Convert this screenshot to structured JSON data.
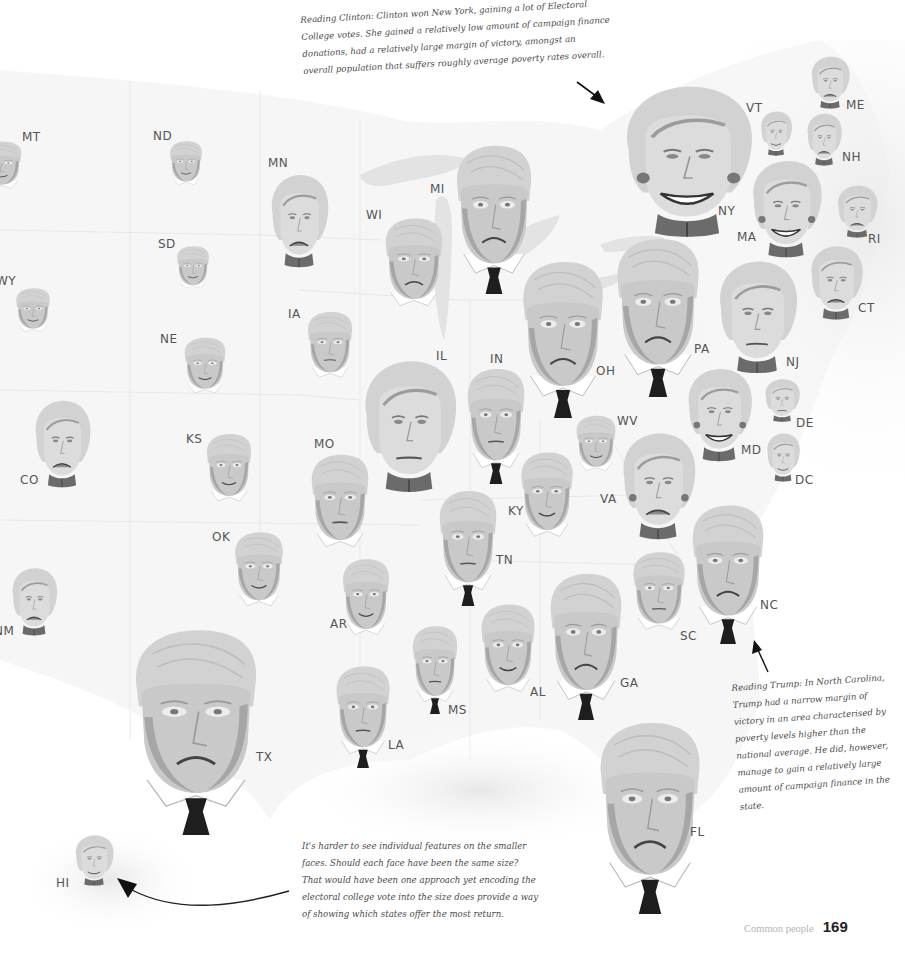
{
  "annotations": {
    "clinton": {
      "lines": [
        "Reading Clinton: Clinton won New York, gaining a lot of Electoral",
        "College votes. She gained a relatively low amount of campaign finance",
        "donations, had a relatively large margin of victory, amongst an",
        "overall population that suffers roughly average poverty rates overall."
      ]
    },
    "trump": {
      "lines": [
        "Reading Trump: In North Carolina,",
        "Trump had a narrow margin of",
        "victory in an area characterised by",
        "poverty levels higher than the",
        "national average. He did, however,",
        "manage to gain a relatively large",
        "amount of campaign finance in the",
        "state."
      ]
    },
    "size": {
      "lines": [
        "It's harder to see individual features on the smaller",
        "faces. Should each face have been the same size?",
        "That would have been one approach yet encoding the",
        "electoral college vote into the size does provide a way",
        "of showing which states offer the most return."
      ]
    }
  },
  "footer": {
    "running_head": "Common people",
    "page_number": "169"
  },
  "colors": {
    "hair": "#d2d2d2",
    "skin": "#c9c9c9",
    "skin_light": "#dcdcdc",
    "jaw_shadow": "#a6a6a6",
    "clinton_collar": "#6b6b6b",
    "trump_tie": "#1e1e1e",
    "label": "#555555",
    "map_fill": "#f4f4f4",
    "map_lines": "#e6e6e6",
    "lakes": "#e2e2e2"
  },
  "chart_data": {
    "type": "chernoff-faces-map",
    "title": "",
    "encoding": {
      "face_type": "winning candidate (Clinton / Trump)",
      "face_size": "electoral college votes",
      "mouth": "margin of victory",
      "eyes_and_lines": "poverty level",
      "extras": "campaign finance"
    },
    "faces": [
      {
        "state": "MT",
        "candidate": "Trump",
        "x": -22,
        "y": 140,
        "w": 46,
        "h": 56,
        "mood": "smile",
        "lx": 22,
        "ly": 130
      },
      {
        "state": "ND",
        "candidate": "Trump",
        "x": 168,
        "y": 140,
        "w": 36,
        "h": 52,
        "mood": "smile",
        "lx": 153,
        "ly": 129
      },
      {
        "state": "SD",
        "candidate": "Trump",
        "x": 175,
        "y": 245,
        "w": 36,
        "h": 50,
        "mood": "smile",
        "lx": 158,
        "ly": 237
      },
      {
        "state": "WY",
        "candidate": "Trump",
        "x": 14,
        "y": 287,
        "w": 38,
        "h": 52,
        "mood": "smile",
        "lx": -4,
        "ly": 274
      },
      {
        "state": "MN",
        "candidate": "Clinton",
        "x": 266,
        "y": 172,
        "w": 66,
        "h": 96,
        "mood": "frown",
        "lx": 268,
        "ly": 156
      },
      {
        "state": "WI",
        "candidate": "Trump",
        "x": 382,
        "y": 216,
        "w": 64,
        "h": 104,
        "mood": "frown",
        "lx": 366,
        "ly": 208
      },
      {
        "state": "MI",
        "candidate": "Trump",
        "x": 452,
        "y": 142,
        "w": 84,
        "h": 152,
        "mood": "frown",
        "tie": true,
        "lx": 430,
        "ly": 182
      },
      {
        "state": "IA",
        "candidate": "Trump",
        "x": 305,
        "y": 310,
        "w": 50,
        "h": 78,
        "mood": "neutral",
        "lx": 288,
        "ly": 307
      },
      {
        "state": "NE",
        "candidate": "Trump",
        "x": 182,
        "y": 336,
        "w": 46,
        "h": 66,
        "mood": "smile",
        "lx": 160,
        "ly": 332
      },
      {
        "state": "CO",
        "candidate": "Clinton",
        "x": 30,
        "y": 398,
        "w": 64,
        "h": 90,
        "mood": "frown",
        "lx": 20,
        "ly": 473
      },
      {
        "state": "KS",
        "candidate": "Trump",
        "x": 204,
        "y": 432,
        "w": 50,
        "h": 80,
        "mood": "smile",
        "lx": 186,
        "ly": 432
      },
      {
        "state": "OK",
        "candidate": "Trump",
        "x": 232,
        "y": 530,
        "w": 54,
        "h": 88,
        "mood": "smile",
        "lx": 212,
        "ly": 530
      },
      {
        "state": "NM",
        "candidate": "Clinton",
        "x": 8,
        "y": 566,
        "w": 52,
        "h": 70,
        "mood": "frown",
        "lx": -6,
        "ly": 624
      },
      {
        "state": "MO",
        "candidate": "Trump",
        "x": 308,
        "y": 452,
        "w": 64,
        "h": 110,
        "mood": "neutral",
        "lx": 314,
        "ly": 437
      },
      {
        "state": "IL",
        "candidate": "Clinton",
        "x": 356,
        "y": 357,
        "w": 106,
        "h": 136,
        "mood": "neutral",
        "lx": 436,
        "ly": 349
      },
      {
        "state": "IN",
        "candidate": "Trump",
        "x": 464,
        "y": 366,
        "w": 64,
        "h": 118,
        "mood": "neutral",
        "tie": true,
        "lx": 490,
        "ly": 352
      },
      {
        "state": "OH",
        "candidate": "Trump",
        "x": 518,
        "y": 258,
        "w": 90,
        "h": 160,
        "mood": "frown",
        "tie": true,
        "lx": 596,
        "ly": 364
      },
      {
        "state": "PA",
        "candidate": "Trump",
        "x": 612,
        "y": 235,
        "w": 92,
        "h": 162,
        "mood": "frown",
        "tie": true,
        "lx": 694,
        "ly": 342
      },
      {
        "state": "NY",
        "candidate": "Clinton",
        "x": 614,
        "y": 82,
        "w": 146,
        "h": 156,
        "mood": "big-smile",
        "earrings": true,
        "lx": 718,
        "ly": 204
      },
      {
        "state": "VT",
        "candidate": "Clinton",
        "x": 758,
        "y": 110,
        "w": 36,
        "h": 46,
        "mood": "smile",
        "lx": 746,
        "ly": 101
      },
      {
        "state": "ME",
        "candidate": "Clinton",
        "x": 808,
        "y": 55,
        "w": 44,
        "h": 54,
        "mood": "frown",
        "lx": 846,
        "ly": 98
      },
      {
        "state": "NH",
        "candidate": "Clinton",
        "x": 804,
        "y": 112,
        "w": 40,
        "h": 54,
        "mood": "frown",
        "lx": 842,
        "ly": 150
      },
      {
        "state": "MA",
        "candidate": "Clinton",
        "x": 746,
        "y": 158,
        "w": 80,
        "h": 100,
        "mood": "big-smile",
        "earrings": true,
        "lx": 737,
        "ly": 230
      },
      {
        "state": "RI",
        "candidate": "Clinton",
        "x": 834,
        "y": 184,
        "w": 46,
        "h": 54,
        "mood": "frown",
        "lx": 868,
        "ly": 232
      },
      {
        "state": "CT",
        "candidate": "Clinton",
        "x": 806,
        "y": 244,
        "w": 60,
        "h": 76,
        "mood": "frown",
        "lx": 858,
        "ly": 301
      },
      {
        "state": "NJ",
        "candidate": "Clinton",
        "x": 712,
        "y": 258,
        "w": 90,
        "h": 116,
        "mood": "neutral",
        "lx": 786,
        "ly": 355
      },
      {
        "state": "DE",
        "candidate": "Clinton",
        "x": 762,
        "y": 378,
        "w": 40,
        "h": 44,
        "mood": "neutral",
        "lx": 796,
        "ly": 416
      },
      {
        "state": "DC",
        "candidate": "Clinton",
        "x": 764,
        "y": 432,
        "w": 38,
        "h": 50,
        "mood": "smile",
        "lx": 795,
        "ly": 473
      },
      {
        "state": "MD",
        "candidate": "Clinton",
        "x": 682,
        "y": 366,
        "w": 74,
        "h": 96,
        "mood": "big-smile",
        "earrings": true,
        "lx": 741,
        "ly": 443
      },
      {
        "state": "WV",
        "candidate": "Trump",
        "x": 574,
        "y": 414,
        "w": 44,
        "h": 66,
        "mood": "smile",
        "lx": 617,
        "ly": 414
      },
      {
        "state": "VA",
        "candidate": "Clinton",
        "x": 616,
        "y": 430,
        "w": 84,
        "h": 110,
        "mood": "frown",
        "earrings": true,
        "lx": 600,
        "ly": 492
      },
      {
        "state": "KY",
        "candidate": "Trump",
        "x": 518,
        "y": 450,
        "w": 58,
        "h": 100,
        "mood": "smile",
        "lx": 508,
        "ly": 504
      },
      {
        "state": "TN",
        "candidate": "Trump",
        "x": 436,
        "y": 488,
        "w": 64,
        "h": 118,
        "mood": "neutral",
        "tie": true,
        "lx": 496,
        "ly": 553
      },
      {
        "state": "AR",
        "candidate": "Trump",
        "x": 340,
        "y": 557,
        "w": 52,
        "h": 90,
        "mood": "smile",
        "lx": 330,
        "ly": 617
      },
      {
        "state": "MS",
        "candidate": "Trump",
        "x": 410,
        "y": 624,
        "w": 50,
        "h": 90,
        "mood": "neutral",
        "tie": true,
        "lx": 448,
        "ly": 703
      },
      {
        "state": "AL",
        "candidate": "Trump",
        "x": 478,
        "y": 602,
        "w": 60,
        "h": 104,
        "mood": "smile",
        "lx": 530,
        "ly": 685
      },
      {
        "state": "GA",
        "candidate": "Trump",
        "x": 546,
        "y": 570,
        "w": 80,
        "h": 150,
        "mood": "frown",
        "tie": true,
        "lx": 620,
        "ly": 676
      },
      {
        "state": "SC",
        "candidate": "Trump",
        "x": 630,
        "y": 550,
        "w": 58,
        "h": 92,
        "mood": "neutral",
        "lx": 680,
        "ly": 629
      },
      {
        "state": "NC",
        "candidate": "Trump",
        "x": 688,
        "y": 502,
        "w": 80,
        "h": 142,
        "mood": "frown",
        "tie": true,
        "lx": 760,
        "ly": 598
      },
      {
        "state": "LA",
        "candidate": "Trump",
        "x": 333,
        "y": 664,
        "w": 60,
        "h": 104,
        "mood": "neutral",
        "tie": true,
        "lx": 388,
        "ly": 738
      },
      {
        "state": "TX",
        "candidate": "Trump",
        "x": 128,
        "y": 625,
        "w": 136,
        "h": 210,
        "mood": "frown",
        "tie": true,
        "lx": 256,
        "ly": 750
      },
      {
        "state": "FL",
        "candidate": "Trump",
        "x": 594,
        "y": 718,
        "w": 112,
        "h": 196,
        "mood": "frown",
        "tie": true,
        "lx": 690,
        "ly": 825
      },
      {
        "state": "HI",
        "candidate": "Clinton",
        "x": 72,
        "y": 834,
        "w": 44,
        "h": 52,
        "mood": "smile",
        "lx": 56,
        "ly": 876
      }
    ]
  }
}
